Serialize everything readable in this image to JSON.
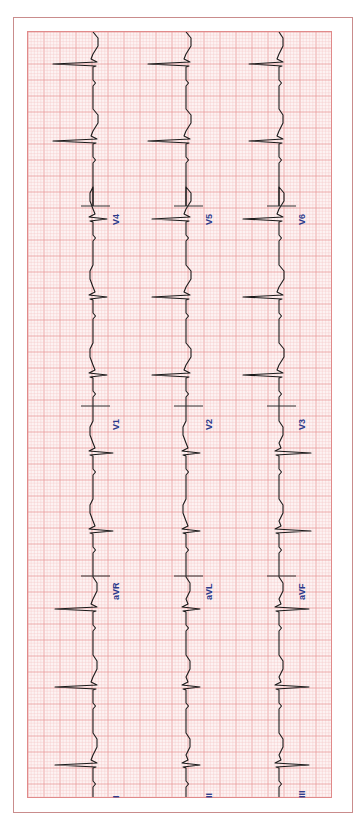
{
  "chart_data": {
    "type": "line",
    "orientation": "rotated-90-clockwise",
    "colors": {
      "paper_bg": "#fdf3f3",
      "minor_grid": "#f5c7c7",
      "major_grid": "#e89a9a",
      "trace": "#1a1a1a",
      "label": "#2b3a8c",
      "frame": "#c98c8c"
    },
    "grid": {
      "major_px": 16,
      "minor_per_major": 5
    },
    "rows": [
      {
        "baseline_x": 92,
        "leads": [
          "I",
          "aVR",
          "V1",
          "V4"
        ]
      },
      {
        "baseline_x": 185,
        "leads": [
          "II",
          "aVL",
          "V2",
          "V5"
        ]
      },
      {
        "baseline_x": 278,
        "leads": [
          "III",
          "aVF",
          "V3",
          "V6"
        ]
      }
    ],
    "lead_boundaries_y": [
      798,
      575,
      405,
      205,
      31
    ],
    "beat_positions_y": [
      764,
      686,
      608,
      530,
      452,
      374,
      296,
      218,
      140,
      63
    ],
    "leads": {
      "I": {
        "qrs": -38,
        "t": 4
      },
      "aVR": {
        "qrs": 20,
        "t": -3
      },
      "V1": {
        "qrs": 14,
        "t": -3
      },
      "V4": {
        "qrs": -40,
        "t": 5
      },
      "II": {
        "qrs": 14,
        "t": 4
      },
      "aVL": {
        "qrs": 14,
        "t": -3
      },
      "V2": {
        "qrs": -34,
        "t": 5
      },
      "V5": {
        "qrs": -38,
        "t": 5
      },
      "III": {
        "qrs": 30,
        "t": 4
      },
      "aVF": {
        "qrs": 32,
        "t": 4
      },
      "V3": {
        "qrs": -36,
        "t": 5
      },
      "V6": {
        "qrs": -30,
        "t": 4
      }
    }
  },
  "labels": {
    "row1": [
      {
        "text": "I",
        "x": 111,
        "y": 798
      },
      {
        "text": "aVR",
        "x": 111,
        "y": 600
      },
      {
        "text": "V1",
        "x": 111,
        "y": 430
      },
      {
        "text": "V4",
        "x": 111,
        "y": 225
      }
    ],
    "row2": [
      {
        "text": "II",
        "x": 204,
        "y": 798
      },
      {
        "text": "aVL",
        "x": 204,
        "y": 600
      },
      {
        "text": "V2",
        "x": 204,
        "y": 430
      },
      {
        "text": "V5",
        "x": 204,
        "y": 225
      }
    ],
    "row3": [
      {
        "text": "III",
        "x": 297,
        "y": 798
      },
      {
        "text": "aVF",
        "x": 297,
        "y": 600
      },
      {
        "text": "V3",
        "x": 297,
        "y": 430
      },
      {
        "text": "V6",
        "x": 297,
        "y": 225
      }
    ]
  }
}
